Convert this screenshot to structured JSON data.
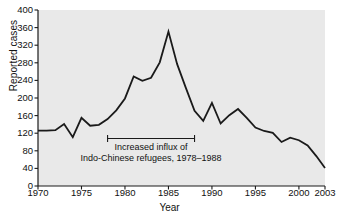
{
  "chart_data": {
    "type": "line",
    "title": "",
    "xlabel": "Year",
    "ylabel": "Reported cases",
    "xlim": [
      1970,
      2003
    ],
    "ylim": [
      0,
      400
    ],
    "grid": false,
    "legend": "none",
    "xticks": [
      1970,
      1975,
      1980,
      1985,
      1990,
      1995,
      2000,
      2003
    ],
    "xtick_labels": [
      "1970",
      "1975",
      "1980",
      "1985",
      "1990",
      "1995",
      "2000",
      "2003"
    ],
    "yticks": [
      0,
      40,
      80,
      120,
      160,
      200,
      240,
      280,
      320,
      360,
      400
    ],
    "ytick_labels": [
      "0",
      "40",
      "80",
      "120",
      "160",
      "200",
      "240",
      "280",
      "320",
      "360",
      "400"
    ],
    "series": [
      {
        "name": "Reported cases",
        "color": "#1a1a1a",
        "x": [
          1970,
          1971,
          1972,
          1973,
          1974,
          1975,
          1976,
          1977,
          1978,
          1979,
          1980,
          1981,
          1982,
          1983,
          1984,
          1985,
          1986,
          1987,
          1988,
          1989,
          1990,
          1991,
          1992,
          1993,
          1994,
          1995,
          1996,
          1997,
          1998,
          1999,
          2000,
          2001,
          2002,
          2003
        ],
        "values": [
          126,
          126,
          127,
          141,
          111,
          155,
          137,
          139,
          152,
          172,
          199,
          249,
          239,
          246,
          281,
          351,
          277,
          223,
          171,
          148,
          189,
          142,
          161,
          175,
          155,
          133,
          125,
          121,
          100,
          110,
          104,
          92,
          68,
          41
        ]
      }
    ],
    "annotations": [
      {
        "type": "range-bracket",
        "x_start": 1978,
        "x_end": 1988,
        "y": 108,
        "label_line1": "Increased influx of",
        "label_line2": "Indo-Chinese refugees, 1978–1988"
      }
    ],
    "style": {
      "plot_background": "#e9e9e9",
      "page_background": "#ffffff",
      "axis_color": "#1a1a1a",
      "text_color": "#111111",
      "line_width": 1.8
    }
  }
}
